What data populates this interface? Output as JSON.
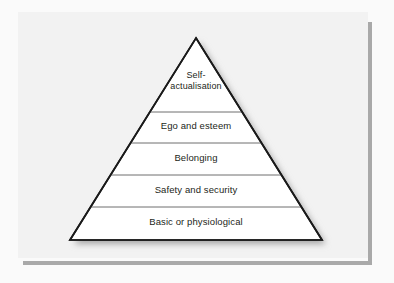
{
  "figure": {
    "kind": "pyramid-diagram",
    "tier_count": 5
  },
  "canvas": {
    "width": 394,
    "height": 283,
    "page_background": "#fafafa"
  },
  "panel": {
    "background": "#f2f2f2",
    "shadow_color": "#a9a9a9"
  },
  "pyramid": {
    "fill": "#ffffff",
    "outline_color": "#1a1a1a",
    "divider_color": "#6e6e6e",
    "shadow_color": "#b5b5b5",
    "apex": {
      "x": 196,
      "y": 38
    },
    "base_left": {
      "x": 70,
      "y": 240
    },
    "base_right": {
      "x": 322,
      "y": 240
    },
    "divider_y": [
      112,
      143,
      175,
      207
    ],
    "tiers": [
      {
        "index": 0,
        "level": 5,
        "label": "Self-\nactualisation",
        "label_oneline": "Self-actualisation"
      },
      {
        "index": 1,
        "level": 4,
        "label": "Ego and esteem",
        "label_oneline": "Ego and esteem"
      },
      {
        "index": 2,
        "level": 3,
        "label": "Belonging",
        "label_oneline": "Belonging"
      },
      {
        "index": 3,
        "level": 2,
        "label": "Safety and security",
        "label_oneline": "Safety and security"
      },
      {
        "index": 4,
        "level": 1,
        "label": "Basic or physiological",
        "label_oneline": "Basic or physiological"
      }
    ]
  }
}
